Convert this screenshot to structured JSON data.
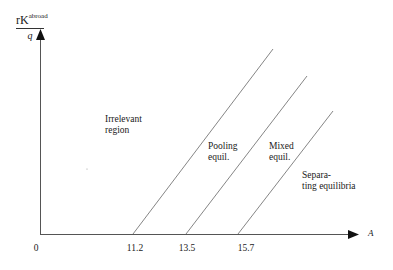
{
  "diagram": {
    "y_axis_label": {
      "numerator": "rK",
      "superscript": "abroad",
      "denominator": "q"
    },
    "x_axis_label": "A",
    "origin_label": "0",
    "ticks": [
      {
        "value": "11.2",
        "x": 133
      },
      {
        "value": "13.5",
        "x": 186
      },
      {
        "value": "15.7",
        "x": 238
      }
    ],
    "regions": [
      {
        "name": "irrelevant",
        "lines": [
          "Irrelevant",
          "region"
        ]
      },
      {
        "name": "pooling",
        "lines": [
          "Pooling",
          "equil."
        ]
      },
      {
        "name": "mixed",
        "lines": [
          "Mixed",
          "equil."
        ]
      },
      {
        "name": "separating",
        "lines": [
          "Separa-",
          "ting equilibria"
        ]
      }
    ],
    "boundary_lines": [
      {
        "from": [
          133,
          234
        ],
        "to": [
          273,
          49
        ]
      },
      {
        "from": [
          186,
          234
        ],
        "to": [
          307,
          76
        ]
      },
      {
        "from": [
          238,
          234
        ],
        "to": [
          333,
          111
        ]
      }
    ],
    "colors": {
      "axis": "#555555",
      "lines": "#777777",
      "text": "#1a1a1a"
    }
  }
}
